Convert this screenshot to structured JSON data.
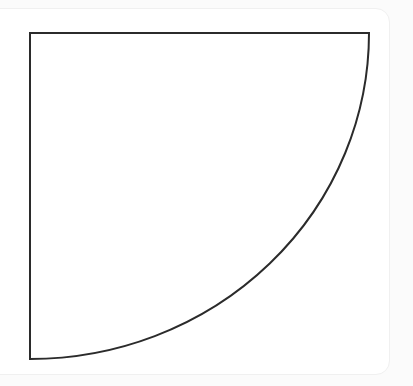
{
  "figure": {
    "title": "",
    "caption": "",
    "background_color": "#fbfbfb",
    "card": {
      "name": "figure-card",
      "background_color": "#ffffff",
      "border_color": "#f0f0f0",
      "corner_radius_px": 14
    }
  },
  "chart_data": {
    "type": "line",
    "title": "",
    "subtitle": "",
    "xlabel": "",
    "ylabel": "",
    "grid": false,
    "legend": null,
    "axis_visible": false,
    "tick_labels_x": [],
    "tick_labels_y": [],
    "xlim": [
      30,
      369
    ],
    "ylim": [
      33,
      359
    ],
    "shape": {
      "name": "quarter-ellipse-region",
      "stroke_color": "#2b2b2b",
      "stroke_width_px": 2,
      "fill": "none",
      "vertices": {
        "top_left": [
          30,
          33
        ],
        "top_right": [
          369,
          33
        ],
        "bottom_left": [
          30,
          359
        ]
      },
      "arc": {
        "type": "elliptical",
        "from": [
          30,
          359
        ],
        "to": [
          369,
          33
        ],
        "center": [
          30,
          33
        ],
        "radius_x": 339,
        "radius_y": 326,
        "sweep": "concave-toward-top-left"
      }
    },
    "series": [
      {
        "name": "boundary-arc",
        "x": [
          30,
          60,
          100,
          150,
          180,
          200,
          225,
          255,
          270,
          290,
          310,
          325,
          340,
          350,
          360,
          365,
          369
        ],
        "values": [
          359,
          358,
          352,
          338,
          322,
          311,
          297,
          281,
          272,
          255,
          227,
          200,
          172,
          148,
          110,
          80,
          33
        ]
      }
    ],
    "edges": [
      {
        "name": "top-edge",
        "from": [
          30,
          33
        ],
        "to": [
          369,
          33
        ]
      },
      {
        "name": "left-edge",
        "from": [
          30,
          33
        ],
        "to": [
          30,
          359
        ]
      }
    ]
  }
}
